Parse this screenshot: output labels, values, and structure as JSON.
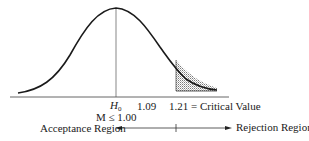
{
  "diagram": {
    "type": "normal-distribution-hypothesis-test",
    "labels": {
      "h0_symbol": "H",
      "h0_subscript": "0",
      "h0_condition": "M ≤ 1.00",
      "value_mid": "1.09",
      "critical": "1.21 = Critical Value",
      "acceptance": "Acceptance Region",
      "rejection": "Rejection Region"
    },
    "colors": {
      "line": "#1a1a1a",
      "axis": "#555555",
      "shade": "#9a9a9a"
    }
  }
}
